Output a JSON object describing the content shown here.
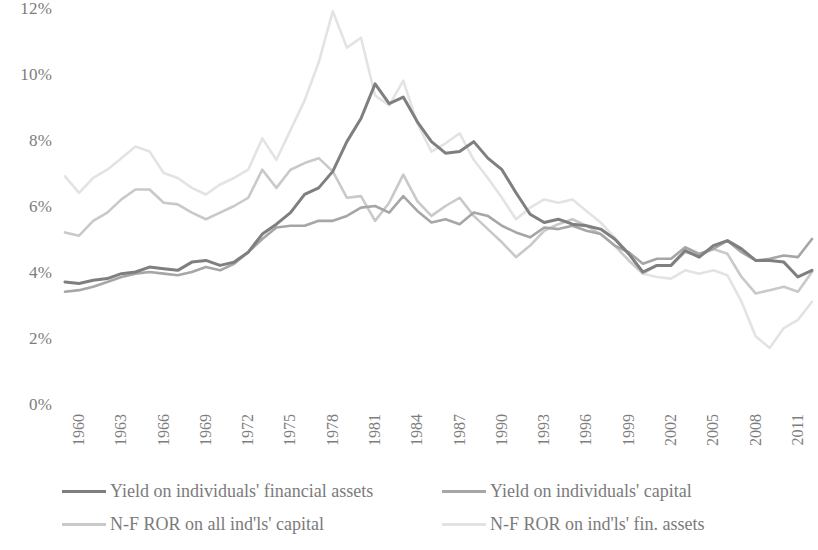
{
  "chart_data": {
    "type": "line",
    "title": "",
    "xlabel": "",
    "ylabel": "",
    "ylim": [
      0,
      12
    ],
    "y_ticks": [
      "0%",
      "2%",
      "4%",
      "6%",
      "8%",
      "10%",
      "12%"
    ],
    "y_tick_values": [
      0,
      2,
      4,
      6,
      8,
      10,
      12
    ],
    "grid": false,
    "legend_position": "bottom",
    "x_start": 1960,
    "x_end": 2013,
    "x_tick_labels": [
      "1960",
      "1963",
      "1966",
      "1969",
      "1972",
      "1975",
      "1978",
      "1981",
      "1984",
      "1987",
      "1990",
      "1993",
      "1996",
      "1999",
      "2002",
      "2005",
      "2008",
      "2011"
    ],
    "x_tick_values": [
      1960,
      1963,
      1966,
      1969,
      1972,
      1975,
      1978,
      1981,
      1984,
      1987,
      1990,
      1993,
      1996,
      1999,
      2002,
      2005,
      2008,
      2011
    ],
    "x": [
      1960,
      1961,
      1962,
      1963,
      1964,
      1965,
      1966,
      1967,
      1968,
      1969,
      1970,
      1971,
      1972,
      1973,
      1974,
      1975,
      1976,
      1977,
      1978,
      1979,
      1980,
      1981,
      1982,
      1983,
      1984,
      1985,
      1986,
      1987,
      1988,
      1989,
      1990,
      1991,
      1992,
      1993,
      1994,
      1995,
      1996,
      1997,
      1998,
      1999,
      2000,
      2001,
      2002,
      2003,
      2004,
      2005,
      2006,
      2007,
      2008,
      2009,
      2010,
      2011,
      2012,
      2013
    ],
    "series": [
      {
        "name": "Yield on individuals' financial assets",
        "color": "#7f7f7f",
        "width": 3.0,
        "values": [
          3.7,
          3.65,
          3.75,
          3.8,
          3.95,
          4.0,
          4.15,
          4.1,
          4.05,
          4.3,
          4.35,
          4.2,
          4.3,
          4.6,
          5.15,
          5.45,
          5.8,
          6.35,
          6.55,
          7.05,
          7.95,
          8.65,
          9.7,
          9.1,
          9.3,
          8.55,
          7.95,
          7.6,
          7.65,
          7.95,
          7.45,
          7.1,
          6.4,
          5.75,
          5.5,
          5.6,
          5.45,
          5.4,
          5.3,
          5.0,
          4.55,
          4.0,
          4.2,
          4.2,
          4.65,
          4.45,
          4.8,
          4.95,
          4.7,
          4.35,
          4.35,
          4.3,
          3.85,
          4.05
        ]
      },
      {
        "name": "Yield on individuals' capital",
        "color": "#a6a6a6",
        "width": 2.6,
        "values": [
          3.4,
          3.45,
          3.55,
          3.7,
          3.85,
          3.95,
          4.0,
          3.95,
          3.9,
          4.0,
          4.15,
          4.05,
          4.25,
          4.6,
          5.0,
          5.35,
          5.4,
          5.4,
          5.55,
          5.55,
          5.7,
          5.95,
          6.0,
          5.8,
          6.3,
          5.85,
          5.5,
          5.6,
          5.45,
          5.8,
          5.7,
          5.4,
          5.2,
          5.05,
          5.35,
          5.3,
          5.4,
          5.25,
          5.15,
          4.8,
          4.6,
          4.25,
          4.4,
          4.4,
          4.75,
          4.55,
          4.7,
          4.95,
          4.6,
          4.35,
          4.4,
          4.5,
          4.45,
          5.0
        ]
      },
      {
        "name": "N-F ROR on all ind'ls' capital",
        "color": "#c9c9c9",
        "width": 2.6,
        "values": [
          5.2,
          5.1,
          5.55,
          5.8,
          6.2,
          6.5,
          6.5,
          6.1,
          6.05,
          5.8,
          5.6,
          5.8,
          6.0,
          6.25,
          7.1,
          6.55,
          7.1,
          7.3,
          7.45,
          7.05,
          6.25,
          6.3,
          5.55,
          6.1,
          6.95,
          6.15,
          5.7,
          6.0,
          6.25,
          5.7,
          5.3,
          4.9,
          4.45,
          4.8,
          5.25,
          5.45,
          5.6,
          5.4,
          5.15,
          4.8,
          4.35,
          3.95,
          4.2,
          4.2,
          4.6,
          4.5,
          4.7,
          4.55,
          3.85,
          3.35,
          3.45,
          3.55,
          3.4,
          4.0
        ]
      },
      {
        "name": "N-F ROR on ind'ls' fin. assets",
        "color": "#e3e3e3",
        "width": 2.6,
        "values": [
          6.9,
          6.4,
          6.85,
          7.1,
          7.45,
          7.8,
          7.65,
          7.0,
          6.85,
          6.55,
          6.35,
          6.65,
          6.85,
          7.1,
          8.05,
          7.4,
          8.3,
          9.2,
          10.35,
          11.9,
          10.8,
          11.1,
          9.35,
          9.05,
          9.8,
          8.5,
          7.65,
          7.9,
          8.2,
          7.4,
          6.85,
          6.25,
          5.6,
          5.95,
          6.2,
          6.1,
          6.2,
          5.85,
          5.5,
          5.05,
          4.55,
          3.95,
          3.85,
          3.8,
          4.05,
          3.95,
          4.05,
          3.9,
          3.1,
          2.05,
          1.7,
          2.3,
          2.55,
          3.1
        ]
      }
    ]
  }
}
